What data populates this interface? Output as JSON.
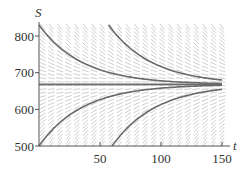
{
  "chart_data": {
    "type": "line",
    "title": "",
    "xlabel": "t",
    "ylabel": "S",
    "xlim": [
      0,
      155
    ],
    "ylim": [
      500,
      830
    ],
    "x_ticks": [
      50,
      100,
      150
    ],
    "y_ticks": [
      500,
      600,
      700,
      800
    ],
    "grid": false,
    "direction_field": true,
    "equilibrium": 668,
    "rate": 0.028,
    "series": [
      {
        "name": "solution-above-1",
        "t0": 0,
        "s0": 830
      },
      {
        "name": "solution-above-2",
        "t0": 57,
        "s0": 830
      },
      {
        "name": "equilibrium",
        "t0": 0,
        "s0": 668
      },
      {
        "name": "solution-below-1",
        "t0": 0,
        "s0": 500
      },
      {
        "name": "solution-below-2",
        "t0": 60,
        "s0": 500
      }
    ],
    "colors": {
      "curve": "#6a6a6a",
      "axis": "#555555",
      "field": "#cfcfcf"
    }
  }
}
